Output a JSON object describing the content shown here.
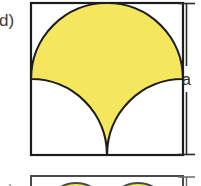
{
  "figure": {
    "background_color": "#ffffff",
    "panel": {
      "label": "d)",
      "label_color": "#3a3a3a",
      "square": {
        "side_label": "a",
        "stroke_color": "#1d1d1d",
        "fill_color": "#ffffff",
        "x": 31,
        "y": 3,
        "size": 152
      },
      "shaded_region": {
        "name": "semicircle-plus-two-quarter-arcs",
        "fill_color": "#f4e75e",
        "stroke_color": "#1d1d1d",
        "description": "Upper semicircle of diameter a spanning the square width, with two quarter-circle arcs of radius a/2 sweeping from the left and right edge midpoints down to a cusp at the bottom-centre of the square."
      },
      "dimension": {
        "label": "a",
        "label_color": "#2b2b2b",
        "line_color": "#2b2b2b",
        "orientation": "vertical",
        "position": "right"
      }
    },
    "next_panel": {
      "label": "e)",
      "label_color": "#8d8d8d",
      "square": {
        "stroke_color": "#4a4a4a",
        "fill_color": "#ffffff"
      },
      "shaded_region": {
        "fill_color": "#f4e75e",
        "stroke_color": "#4a4a4a"
      },
      "dimension": {
        "line_color": "#6a6a6a"
      }
    }
  }
}
